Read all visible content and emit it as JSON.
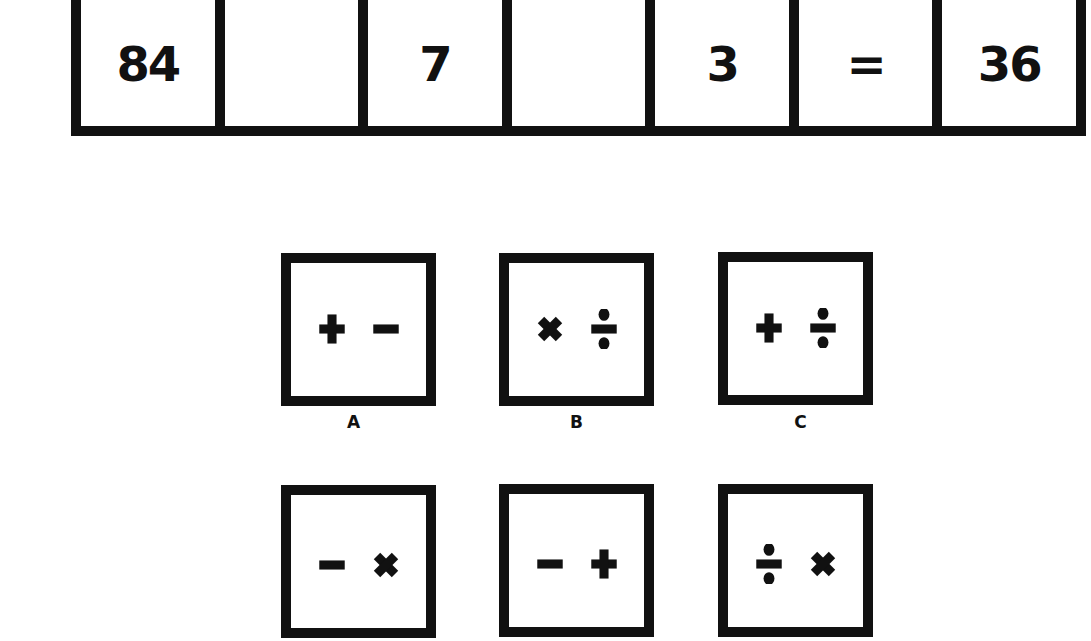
{
  "equation": {
    "cells": [
      {
        "value": "84",
        "type": "number"
      },
      {
        "value": "",
        "type": "blank"
      },
      {
        "value": "7",
        "type": "number"
      },
      {
        "value": "",
        "type": "blank"
      },
      {
        "value": "3",
        "type": "number"
      },
      {
        "value": "=",
        "type": "equals"
      },
      {
        "value": "36",
        "type": "number"
      }
    ]
  },
  "options": [
    {
      "label": "A",
      "symbols": [
        "plus",
        "minus"
      ]
    },
    {
      "label": "B",
      "symbols": [
        "multiply",
        "divide"
      ]
    },
    {
      "label": "C",
      "symbols": [
        "plus",
        "divide"
      ]
    },
    {
      "label": "",
      "symbols": [
        "minus",
        "multiply"
      ]
    },
    {
      "label": "",
      "symbols": [
        "minus",
        "plus"
      ]
    },
    {
      "label": "",
      "symbols": [
        "divide",
        "multiply"
      ]
    }
  ],
  "colors": {
    "ink": "#111111",
    "paper": "#ffffff"
  }
}
